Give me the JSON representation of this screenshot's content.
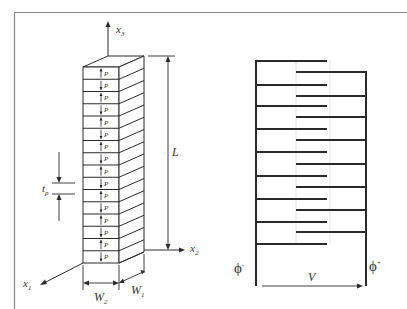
{
  "figure": {
    "frame_color": "#8a8a8a",
    "line_color": "#2a2a2a",
    "guide_color": "#e4e4e4"
  },
  "stack": {
    "axis_x3_label": "x",
    "axis_x3_sub": "3",
    "axis_x2_label": "x",
    "axis_x2_sub": "2",
    "axis_x1_label": "x",
    "axis_x1_sub": "1",
    "length_label": "L",
    "thickness_label": "t",
    "thickness_sub": "p",
    "width2_label": "W",
    "width2_sub": "2",
    "width1_label": "W",
    "width1_sub": "1",
    "layer_label": "P",
    "layer_count": 16
  },
  "electrodes": {
    "phi_minus_label": "ϕ",
    "phi_minus_sup": "-",
    "phi_plus_label": "ϕ",
    "phi_plus_sup": "+",
    "voltage_label": "V",
    "left_fingers_y": [
      61,
      85,
      106,
      129,
      152,
      176,
      199,
      222,
      244
    ],
    "right_fingers_y": [
      72,
      96,
      117,
      140,
      164,
      187,
      210,
      232
    ]
  }
}
